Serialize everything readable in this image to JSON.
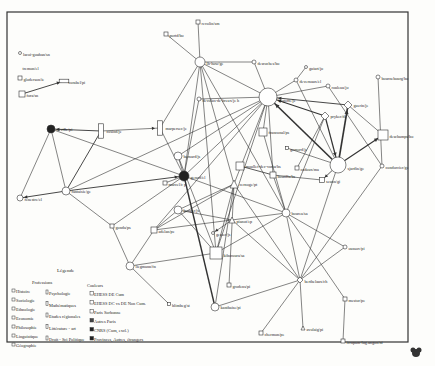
{
  "diagram": {
    "nodes": [
      {
        "id": "lacoi",
        "label": "lacoi-gouhan/sn",
        "x": 20,
        "y": 53,
        "shape": "circle",
        "r": 1.5,
        "fill": "#fff"
      },
      {
        "id": "tremon",
        "label": "tremon/el",
        "x": 20,
        "y": 67,
        "shape": "none",
        "r": 0,
        "fill": "#fff"
      },
      {
        "id": "gloderson",
        "label": "gloderson/ie",
        "x": 20,
        "y": 78,
        "shape": "square",
        "r": 2,
        "fill": "#fff"
      },
      {
        "id": "corabel",
        "label": "corabel/pi",
        "x": 64,
        "y": 81,
        "shape": "rect-wide",
        "r": 3,
        "fill": "#fff"
      },
      {
        "id": "fora",
        "label": "fora/sn",
        "x": 22,
        "y": 94,
        "shape": "square",
        "r": 3,
        "fill": "#fff"
      },
      {
        "id": "portd",
        "label": "portd/bo",
        "x": 166,
        "y": 34,
        "shape": "square",
        "r": 2,
        "fill": "#fff"
      },
      {
        "id": "revolin",
        "label": "revolin/sm",
        "x": 198,
        "y": 22,
        "shape": "square",
        "r": 2,
        "fill": "#fff"
      },
      {
        "id": "lhon",
        "label": "lh-how/ge",
        "x": 200,
        "y": 62,
        "shape": "circle",
        "r": 5,
        "fill": "#fff"
      },
      {
        "id": "desroches",
        "label": "desroches/bo",
        "x": 254,
        "y": 62,
        "shape": "circle",
        "r": 2,
        "fill": "#fff"
      },
      {
        "id": "bogoffe",
        "label": "bogoffe/je",
        "x": 268,
        "y": 97,
        "shape": "circle",
        "r": 9,
        "fill": "#fff"
      },
      {
        "id": "guiart",
        "label": "guiart/jo",
        "x": 306,
        "y": 67,
        "shape": "circle",
        "r": 1.5,
        "fill": "#fff"
      },
      {
        "id": "deveruaux",
        "label": "devernaux/el",
        "x": 296,
        "y": 80,
        "shape": "circle",
        "r": 2,
        "fill": "#fff"
      },
      {
        "id": "rouleau",
        "label": "rouleau/jo",
        "x": 328,
        "y": 86,
        "shape": "circle",
        "r": 2,
        "fill": "#fff"
      },
      {
        "id": "bournebourg",
        "label": "bournebourg/bo",
        "x": 378,
        "y": 77,
        "shape": "circle",
        "r": 2,
        "fill": "#fff"
      },
      {
        "id": "guerin",
        "label": "guerin/je",
        "x": 348,
        "y": 105,
        "shape": "diamond",
        "r": 4,
        "fill": "#fff"
      },
      {
        "id": "pryker",
        "label": "pryker/de",
        "x": 325,
        "y": 116,
        "shape": "diamond",
        "r": 4,
        "fill": "#fff"
      },
      {
        "id": "deschamps",
        "label": "deschamps/bo",
        "x": 383,
        "y": 135,
        "shape": "square",
        "r": 5,
        "fill": "#fff"
      },
      {
        "id": "sjardin",
        "label": "sjardin/ge",
        "x": 338,
        "y": 165,
        "shape": "circle",
        "r": 8,
        "fill": "#fff"
      },
      {
        "id": "condorcier",
        "label": "condorcier/ge",
        "x": 382,
        "y": 166,
        "shape": "circle",
        "r": 2,
        "fill": "#fff"
      },
      {
        "id": "cadoux",
        "label": "cadoux/ma",
        "x": 297,
        "y": 168,
        "shape": "square",
        "r": 2,
        "fill": "#fff"
      },
      {
        "id": "seuon",
        "label": "seuon/gi",
        "x": 322,
        "y": 180,
        "shape": "square",
        "r": 2.5,
        "fill": "#fff"
      },
      {
        "id": "gomord",
        "label": "gomord/je",
        "x": 287,
        "y": 148,
        "shape": "square",
        "r": 1.5,
        "fill": "#fff"
      },
      {
        "id": "devolus",
        "label": "devolus-de-breux/je h",
        "x": 199,
        "y": 99,
        "shape": "circle",
        "r": 2,
        "fill": "#fff"
      },
      {
        "id": "marpersec",
        "label": "marpersec/je",
        "x": 160,
        "y": 128,
        "shape": "rect-tall",
        "r": 4,
        "fill": "#fff"
      },
      {
        "id": "franconal",
        "label": "franconal/ps",
        "x": 263,
        "y": 132,
        "shape": "square",
        "r": 4,
        "fill": "#fff"
      },
      {
        "id": "moullet",
        "label": "moullet-dec-voriu/bs",
        "x": 240,
        "y": 166,
        "shape": "square",
        "r": 4,
        "fill": "#fff"
      },
      {
        "id": "boutilla",
        "label": "boutilla/bs",
        "x": 273,
        "y": 175,
        "shape": "square",
        "r": 3,
        "fill": "#fff"
      },
      {
        "id": "cosind",
        "label": "cosind/je",
        "x": 101,
        "y": 131,
        "shape": "rect-tall",
        "r": 4,
        "fill": "#fff"
      },
      {
        "id": "neville",
        "label": "neville/pi",
        "x": 51,
        "y": 129,
        "shape": "circle",
        "r": 4,
        "fill": "#222"
      },
      {
        "id": "fantaisie",
        "label": "fantaisie/ge",
        "x": 66,
        "y": 191,
        "shape": "circle",
        "r": 4,
        "fill": "#fff"
      },
      {
        "id": "fenestre",
        "label": "fenestre/el",
        "x": 20,
        "y": 198,
        "shape": "circle",
        "r": 3,
        "fill": "#fff"
      },
      {
        "id": "gerard",
        "label": "gerard/el",
        "x": 184,
        "y": 176,
        "shape": "circle",
        "r": 5,
        "fill": "#222"
      },
      {
        "id": "bernard",
        "label": "bernard/js",
        "x": 178,
        "y": 156,
        "shape": "circle",
        "r": 4,
        "fill": "#fff"
      },
      {
        "id": "marcel",
        "label": "marcel/c p",
        "x": 165,
        "y": 183,
        "shape": "square",
        "r": 2,
        "fill": "#fff"
      },
      {
        "id": "cernoge",
        "label": "cernoge/pt",
        "x": 234,
        "y": 184,
        "shape": "triangle",
        "r": 4,
        "fill": "#fff"
      },
      {
        "id": "bouger",
        "label": "bouger/js",
        "x": 178,
        "y": 210,
        "shape": "circle",
        "r": 4,
        "fill": "#fff"
      },
      {
        "id": "gonda",
        "label": "gonda/ps",
        "x": 112,
        "y": 226,
        "shape": "square",
        "r": 2,
        "fill": "#fff"
      },
      {
        "id": "adelan",
        "label": "adelan/pe",
        "x": 154,
        "y": 230,
        "shape": "square",
        "r": 3,
        "fill": "#fff"
      },
      {
        "id": "pianot",
        "label": "pianot/ep",
        "x": 232,
        "y": 220,
        "shape": "triangle",
        "r": 3,
        "fill": "#fff"
      },
      {
        "id": "gesser",
        "label": "gesser/js",
        "x": 213,
        "y": 233,
        "shape": "circle",
        "r": 1.5,
        "fill": "#fff"
      },
      {
        "id": "bourea",
        "label": "bourea/sa",
        "x": 286,
        "y": 213,
        "shape": "circle",
        "r": 4,
        "fill": "#fff"
      },
      {
        "id": "kiboroura",
        "label": "kiboroura/sa",
        "x": 216,
        "y": 253,
        "shape": "square",
        "r": 6,
        "fill": "#fff"
      },
      {
        "id": "liegmann",
        "label": "liegmann/fn",
        "x": 130,
        "y": 266,
        "shape": "circle",
        "r": 4,
        "fill": "#fff"
      },
      {
        "id": "grodens",
        "label": "grodens/pi",
        "x": 229,
        "y": 285,
        "shape": "square",
        "r": 2,
        "fill": "#fff"
      },
      {
        "id": "blimbeg",
        "label": "blimbeg/st",
        "x": 169,
        "y": 304,
        "shape": "square",
        "r": 1.5,
        "fill": "#fff"
      },
      {
        "id": "kanthaise",
        "label": "kanthaise/pi",
        "x": 215,
        "y": 307,
        "shape": "circle",
        "r": 4,
        "fill": "#fff"
      },
      {
        "id": "oussov",
        "label": "oussov/pi",
        "x": 345,
        "y": 247,
        "shape": "circle",
        "r": 2,
        "fill": "#fff"
      },
      {
        "id": "berthelaux",
        "label": "berthelaux/ch",
        "x": 300,
        "y": 280,
        "shape": "diamond",
        "r": 3,
        "fill": "#fff"
      },
      {
        "id": "chermon",
        "label": "chermon/pe",
        "x": 261,
        "y": 333,
        "shape": "square",
        "r": 2,
        "fill": "#fff"
      },
      {
        "id": "mestor",
        "label": "mestor/pe",
        "x": 345,
        "y": 299,
        "shape": "square",
        "r": 2,
        "fill": "#fff"
      },
      {
        "id": "avolaig",
        "label": "avolaig/pi",
        "x": 303,
        "y": 328,
        "shape": "triangle",
        "r": 2,
        "fill": "#fff"
      },
      {
        "id": "icrupam",
        "label": "icrupam-lug.angon/ni",
        "x": 343,
        "y": 341,
        "shape": "square",
        "r": 2,
        "fill": "#fff"
      }
    ],
    "edges": [
      [
        "fora",
        "corabel",
        0.9,
        1
      ],
      [
        "cosind",
        "neville",
        0.9,
        1
      ],
      [
        "cosind",
        "marpersec",
        0.6,
        1
      ],
      [
        "marpersec",
        "gerard",
        0.6,
        0
      ],
      [
        "marpersec",
        "lhon",
        0.6,
        0
      ],
      [
        "neville",
        "fantaisie",
        0.6,
        0
      ],
      [
        "neville",
        "fenestre",
        0.6,
        0
      ],
      [
        "neville",
        "gerard",
        0.6,
        0
      ],
      [
        "fantaisie",
        "fenestre",
        0.9,
        1
      ],
      [
        "fantaisie",
        "gerard",
        0.9,
        1
      ],
      [
        "cosind",
        "fantaisie",
        0.9,
        0
      ],
      [
        "fantaisie",
        "gonda",
        0.6,
        0
      ],
      [
        "fantaisie",
        "bogoffe",
        0.6,
        0
      ],
      [
        "gonda",
        "liegmann",
        0.6,
        0
      ],
      [
        "gonda",
        "gerard",
        0.6,
        0
      ],
      [
        "portd",
        "lhon",
        0.6,
        0
      ],
      [
        "revolin",
        "lhon",
        0.6,
        0
      ],
      [
        "lhon",
        "desroches",
        0.6,
        0
      ],
      [
        "lhon",
        "bogoffe",
        0.6,
        0
      ],
      [
        "desroches",
        "bogoffe",
        0.6,
        0
      ],
      [
        "lhon",
        "gerard",
        0.6,
        0
      ],
      [
        "lhon",
        "kiboroura",
        0.6,
        0
      ],
      [
        "lhon",
        "bourea",
        0.6,
        0
      ],
      [
        "lhon",
        "cernoge",
        0.6,
        0
      ],
      [
        "devolus",
        "gerard",
        0.6,
        0
      ],
      [
        "devolus",
        "bogoffe",
        0.6,
        0
      ],
      [
        "gerard",
        "kanthaise",
        1.4,
        0
      ],
      [
        "gerard",
        "bourea",
        0.6,
        0
      ],
      [
        "bernard",
        "bogoffe",
        0.6,
        0
      ],
      [
        "bernard",
        "kiboroura",
        0.6,
        0
      ],
      [
        "bernard",
        "gerard",
        0.6,
        0
      ],
      [
        "bogoffe",
        "cernoge",
        0.6,
        0
      ],
      [
        "bogoffe",
        "adelan",
        0.6,
        0
      ],
      [
        "bogoffe",
        "kiboroura",
        0.6,
        0
      ],
      [
        "bogoffe",
        "boutilla",
        0.6,
        0
      ],
      [
        "sjardin",
        "bogoffe",
        1.6,
        1
      ],
      [
        "pryker",
        "bogoffe",
        1.1,
        1
      ],
      [
        "guerin",
        "bogoffe",
        0.9,
        1
      ],
      [
        "rouleau",
        "bogoffe",
        0.6,
        0
      ],
      [
        "deveruaux",
        "bogoffe",
        0.6,
        0
      ],
      [
        "guiart",
        "deveruaux",
        0.6,
        0
      ],
      [
        "deveruaux",
        "sjardin",
        0.6,
        0
      ],
      [
        "rouleau",
        "condorcier",
        0.6,
        0
      ],
      [
        "pryker",
        "sjardin",
        1.2,
        1
      ],
      [
        "sjardin",
        "guerin",
        1.6,
        1
      ],
      [
        "sjardin",
        "deschamps",
        1.2,
        1
      ],
      [
        "guerin",
        "deschamps",
        0.6,
        0
      ],
      [
        "bournebourg",
        "condorcier",
        0.6,
        0
      ],
      [
        "condorcier",
        "berthelaux",
        0.6,
        0
      ],
      [
        "pryker",
        "cadoux",
        0.6,
        0
      ],
      [
        "pryker",
        "bourea",
        0.6,
        0
      ],
      [
        "seuon",
        "boutilla",
        0.6,
        0
      ],
      [
        "sjardin",
        "seuon",
        0.8,
        1
      ],
      [
        "moullet",
        "boutilla",
        0.8,
        0
      ],
      [
        "boutilla",
        "bourea",
        0.6,
        0
      ],
      [
        "franconal",
        "bourea",
        0.6,
        0
      ],
      [
        "bogoffe",
        "franconal",
        0.6,
        0
      ],
      [
        "gomord",
        "sjardin",
        0.6,
        0
      ],
      [
        "bouger",
        "cernoge",
        0.6,
        0
      ],
      [
        "cernoge",
        "kiboroura",
        0.6,
        0
      ],
      [
        "cernoge",
        "grodens",
        0.6,
        0
      ],
      [
        "cernoge",
        "kanthaise",
        0.6,
        0
      ],
      [
        "cernoge",
        "adelan",
        0.6,
        0
      ],
      [
        "adelan",
        "bourea",
        0.6,
        0
      ],
      [
        "adelan",
        "liegmann",
        0.6,
        0
      ],
      [
        "liegmann",
        "kiboroura",
        0.6,
        0
      ],
      [
        "liegmann",
        "blimbeg",
        0.6,
        0
      ],
      [
        "pianot",
        "gesser",
        0.6,
        1
      ],
      [
        "pianot",
        "bouger",
        0.6,
        0
      ],
      [
        "pianot",
        "berthelaux",
        0.6,
        0
      ],
      [
        "bourea",
        "oussov",
        0.6,
        0
      ],
      [
        "bourea",
        "berthelaux",
        0.6,
        0
      ],
      [
        "bourea",
        "mestor",
        0.6,
        0
      ],
      [
        "bourea",
        "kiboroura",
        0.6,
        0
      ],
      [
        "berthelaux",
        "oussov",
        0.6,
        0
      ],
      [
        "berthelaux",
        "avolaig",
        0.6,
        0
      ],
      [
        "berthelaux",
        "chermon",
        0.6,
        0
      ],
      [
        "berthelaux",
        "cernoge",
        0.6,
        0
      ],
      [
        "berthelaux",
        "kanthaise",
        0.6,
        0
      ],
      [
        "mestor",
        "icrupam",
        0.6,
        0
      ],
      [
        "bouger",
        "adelan",
        0.6,
        0
      ],
      [
        "marcel",
        "gerard",
        0.6,
        0
      ],
      [
        "sjardin",
        "berthelaux",
        0.6,
        0
      ],
      [
        "kiboroura",
        "bouger",
        0.6,
        0
      ],
      [
        "gerard",
        "bogoffe",
        0.6,
        0
      ]
    ],
    "legend": {
      "title": "Légende",
      "professions_title": "Professions",
      "professions_col1": [
        "Histoire",
        "Sociologie",
        "Ethnologie",
        "Economie",
        "Philosophie",
        "Linguistique",
        "Géographie"
      ],
      "professions_col2": [
        "Psychologie",
        "Mathématiques",
        "Etudes régionales",
        "Littérature - art",
        "Droit - Sci Politique"
      ],
      "couleurs_title": "Couleurs",
      "couleurs": [
        {
          "label": "EHESS DE Cum",
          "fill": "#fff"
        },
        {
          "label": "EHESS DC vs DE Non Cum.",
          "fill": "#fff"
        },
        {
          "label": "Paris Sorbonne",
          "fill": "#fff"
        },
        {
          "label": "Autres Paris",
          "fill": "#444"
        },
        {
          "label": "CNRS (Cum, excl.)",
          "fill": "#222"
        },
        {
          "label": "Provinces, Autres, étrangers",
          "fill": "#222"
        }
      ]
    }
  }
}
